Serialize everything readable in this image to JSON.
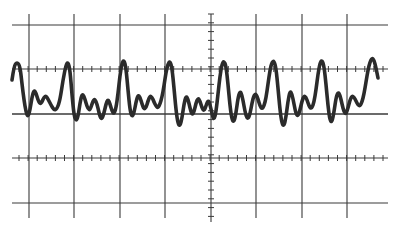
{
  "figure": {
    "background_color": "#ffffff",
    "grid_color": "#3a3a3a",
    "trace_color": "#2b2b2b"
  },
  "graticule": {
    "x_range": [
      12,
      388
    ],
    "y_range": [
      14,
      222
    ],
    "horizontal_lines_y": [
      25,
      69,
      114,
      158,
      203
    ],
    "vertical_lines_x": [
      29,
      74,
      120,
      165,
      256,
      302,
      347
    ],
    "center_vertical_axis_x": 211,
    "tick_axes_y": [
      69,
      158
    ],
    "tick_spacing": 9.1,
    "tick_length": 6
  },
  "chart_data": {
    "type": "line",
    "title": "",
    "xlabel": "",
    "ylabel": "",
    "grid": true,
    "divisions": {
      "horizontal": 8,
      "vertical": 4
    },
    "series": [
      {
        "name": "trace",
        "points": [
          [
            12,
            80
          ],
          [
            14,
            66
          ],
          [
            17,
            62
          ],
          [
            20,
            66
          ],
          [
            22,
            84
          ],
          [
            24,
            100
          ],
          [
            26,
            112
          ],
          [
            28,
            117
          ],
          [
            30,
            110
          ],
          [
            32,
            97
          ],
          [
            34,
            90
          ],
          [
            36,
            93
          ],
          [
            38,
            100
          ],
          [
            40,
            104
          ],
          [
            42,
            102
          ],
          [
            44,
            97
          ],
          [
            46,
            96
          ],
          [
            48,
            99
          ],
          [
            51,
            105
          ],
          [
            54,
            110
          ],
          [
            57,
            109
          ],
          [
            60,
            100
          ],
          [
            63,
            80
          ],
          [
            66,
            65
          ],
          [
            68,
            62
          ],
          [
            70,
            70
          ],
          [
            72,
            95
          ],
          [
            74,
            115
          ],
          [
            76,
            121
          ],
          [
            78,
            117
          ],
          [
            80,
            103
          ],
          [
            82,
            94
          ],
          [
            84,
            96
          ],
          [
            86,
            103
          ],
          [
            88,
            109
          ],
          [
            90,
            110
          ],
          [
            92,
            104
          ],
          [
            94,
            99
          ],
          [
            96,
            101
          ],
          [
            98,
            108
          ],
          [
            100,
            117
          ],
          [
            102,
            119
          ],
          [
            104,
            113
          ],
          [
            106,
            104
          ],
          [
            108,
            99
          ],
          [
            110,
            104
          ],
          [
            112,
            111
          ],
          [
            114,
            114
          ],
          [
            116,
            108
          ],
          [
            118,
            94
          ],
          [
            120,
            75
          ],
          [
            122,
            63
          ],
          [
            124,
            60
          ],
          [
            126,
            68
          ],
          [
            128,
            90
          ],
          [
            130,
            110
          ],
          [
            132,
            117
          ],
          [
            134,
            113
          ],
          [
            136,
            102
          ],
          [
            138,
            95
          ],
          [
            140,
            97
          ],
          [
            142,
            104
          ],
          [
            144,
            109
          ],
          [
            146,
            108
          ],
          [
            148,
            101
          ],
          [
            150,
            96
          ],
          [
            152,
            97
          ],
          [
            154,
            102
          ],
          [
            156,
            106
          ],
          [
            158,
            108
          ],
          [
            160,
            104
          ],
          [
            162,
            97
          ],
          [
            164,
            86
          ],
          [
            166,
            72
          ],
          [
            168,
            64
          ],
          [
            170,
            61
          ],
          [
            172,
            68
          ],
          [
            174,
            88
          ],
          [
            176,
            110
          ],
          [
            178,
            124
          ],
          [
            180,
            126
          ],
          [
            182,
            118
          ],
          [
            184,
            104
          ],
          [
            186,
            96
          ],
          [
            188,
            99
          ],
          [
            190,
            108
          ],
          [
            192,
            115
          ],
          [
            194,
            112
          ],
          [
            196,
            103
          ],
          [
            198,
            98
          ],
          [
            200,
            101
          ],
          [
            202,
            108
          ],
          [
            204,
            111
          ],
          [
            206,
            106
          ],
          [
            208,
            100
          ],
          [
            210,
            104
          ],
          [
            212,
            114
          ],
          [
            214,
            120
          ],
          [
            216,
            112
          ],
          [
            218,
            94
          ],
          [
            220,
            76
          ],
          [
            222,
            64
          ],
          [
            224,
            61
          ],
          [
            226,
            66
          ],
          [
            228,
            84
          ],
          [
            230,
            106
          ],
          [
            232,
            120
          ],
          [
            234,
            122
          ],
          [
            236,
            113
          ],
          [
            238,
            98
          ],
          [
            240,
            91
          ],
          [
            242,
            95
          ],
          [
            244,
            106
          ],
          [
            246,
            116
          ],
          [
            248,
            119
          ],
          [
            250,
            114
          ],
          [
            252,
            103
          ],
          [
            254,
            95
          ],
          [
            256,
            94
          ],
          [
            258,
            99
          ],
          [
            260,
            106
          ],
          [
            262,
            109
          ],
          [
            264,
            106
          ],
          [
            266,
            98
          ],
          [
            268,
            84
          ],
          [
            270,
            70
          ],
          [
            272,
            62
          ],
          [
            274,
            61
          ],
          [
            276,
            68
          ],
          [
            278,
            88
          ],
          [
            280,
            110
          ],
          [
            282,
            124
          ],
          [
            284,
            126
          ],
          [
            286,
            117
          ],
          [
            288,
            101
          ],
          [
            290,
            91
          ],
          [
            292,
            94
          ],
          [
            294,
            104
          ],
          [
            296,
            114
          ],
          [
            298,
            116
          ],
          [
            300,
            110
          ],
          [
            302,
            101
          ],
          [
            304,
            96
          ],
          [
            306,
            97
          ],
          [
            308,
            103
          ],
          [
            310,
            108
          ],
          [
            312,
            108
          ],
          [
            314,
            102
          ],
          [
            316,
            90
          ],
          [
            318,
            74
          ],
          [
            320,
            63
          ],
          [
            322,
            60
          ],
          [
            324,
            66
          ],
          [
            326,
            84
          ],
          [
            328,
            106
          ],
          [
            330,
            121
          ],
          [
            332,
            122
          ],
          [
            334,
            112
          ],
          [
            336,
            98
          ],
          [
            338,
            92
          ],
          [
            340,
            95
          ],
          [
            342,
            104
          ],
          [
            344,
            112
          ],
          [
            346,
            114
          ],
          [
            348,
            108
          ],
          [
            350,
            100
          ],
          [
            352,
            96
          ],
          [
            354,
            97
          ],
          [
            356,
            101
          ],
          [
            358,
            105
          ],
          [
            360,
            106
          ],
          [
            362,
            102
          ],
          [
            364,
            94
          ],
          [
            366,
            82
          ],
          [
            368,
            70
          ],
          [
            370,
            62
          ],
          [
            372,
            58
          ],
          [
            374,
            60
          ],
          [
            376,
            68
          ],
          [
            378,
            78
          ]
        ]
      }
    ]
  }
}
